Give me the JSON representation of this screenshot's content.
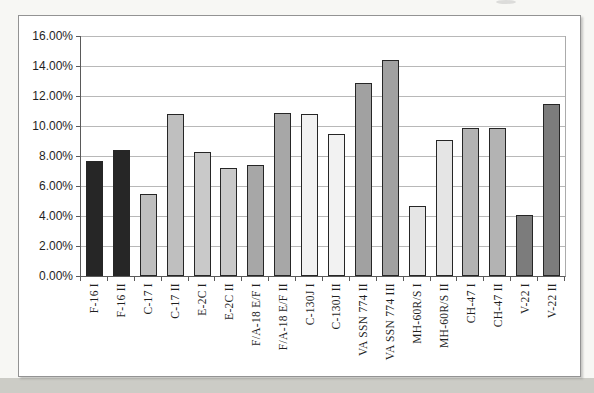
{
  "chart_data": {
    "type": "bar",
    "legend": "none",
    "grid": "horizontal lines every 2%",
    "unit": "percent",
    "ylim_percent": [
      0,
      16
    ],
    "y_tick_labels": [
      "16.00%",
      "14.00%",
      "12.00%",
      "10.00%",
      "8.00%",
      "6.00%",
      "4.00%",
      "2.00%",
      "0.00%"
    ],
    "categories": [
      "F-16 I",
      "F-16 II",
      "C-17 I",
      "C-17 II",
      "E-2C I",
      "E-2C II",
      "F/A-18 E/F I",
      "F/A-18 E/F II",
      "C-130J I",
      "C-130J II",
      "VA SSN 774 II",
      "VA SSN 774 III",
      "MH-60R/S I",
      "MH-60R/S II",
      "CH-47 I",
      "CH-47 II",
      "V-22 I",
      "V-22 II"
    ],
    "values": [
      7.7,
      8.4,
      5.5,
      10.8,
      8.3,
      7.2,
      7.4,
      10.9,
      10.8,
      9.5,
      12.9,
      14.4,
      4.7,
      9.1,
      9.9,
      9.9,
      4.1,
      11.5
    ],
    "bar_colors": [
      "#262626",
      "#262626",
      "#bfbfbf",
      "#bfbfbf",
      "#c9c9c9",
      "#c9c9c9",
      "#a7a7a7",
      "#a7a7a7",
      "#f2f2f2",
      "#f2f2f2",
      "#a1a1a1",
      "#a1a1a1",
      "#e5e5e5",
      "#e5e5e5",
      "#b3b3b3",
      "#b3b3b3",
      "#7c7c7c",
      "#7c7c7c"
    ],
    "bar_border_color": "#262626"
  }
}
